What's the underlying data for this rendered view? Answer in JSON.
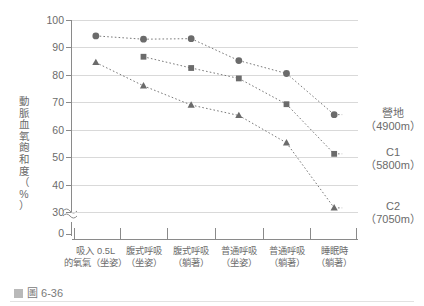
{
  "caption": {
    "marker_icon": "figure-icon",
    "text": "圖 6-36"
  },
  "chart_data": {
    "type": "line",
    "title": "",
    "subtitle": "",
    "xlabel": "",
    "ylabel": "動脈血氧飽和度（%）",
    "ylabel_chars": [
      "動",
      "脈",
      "血",
      "氧",
      "飽",
      "和",
      "度",
      "（",
      "%",
      "）"
    ],
    "ylim": [
      30,
      100
    ],
    "yticks": [
      100,
      90,
      80,
      70,
      60,
      50,
      40,
      30
    ],
    "y_axis_break": true,
    "y_break_base_tick": 0,
    "grid": true,
    "grid_axis": "y",
    "legend_position": "right",
    "categories": [
      "吸入 0.5L 的氧氣（坐姿）",
      "腹式呼吸（坐姿）",
      "腹式呼吸（躺著）",
      "普通呼吸（坐姿）",
      "普通呼吸（躺著）",
      "睡眠時（躺著）"
    ],
    "category_lines": [
      {
        "line1": "吸入 0.5L",
        "line2": "的氧氣（坐姿）"
      },
      {
        "line1": "腹式呼吸",
        "line2": "（坐姿）"
      },
      {
        "line1": "腹式呼吸",
        "line2": "（躺著）"
      },
      {
        "line1": "普通呼吸",
        "line2": "（坐姿）"
      },
      {
        "line1": "普通呼吸",
        "line2": "（躺著）"
      },
      {
        "line1": "睡眠時",
        "line2": "（躺著）"
      }
    ],
    "series": [
      {
        "name": "營地",
        "altitude": "（4900m）",
        "marker": "circle",
        "color": "#6b6b6b",
        "values": [
          94.2,
          93.0,
          93.2,
          85.2,
          80.5,
          65.5
        ]
      },
      {
        "name": "C1",
        "altitude": "（5800m）",
        "marker": "square",
        "color": "#6b6b6b",
        "values": [
          null,
          86.6,
          82.5,
          78.7,
          69.3,
          51.2
        ]
      },
      {
        "name": "C2",
        "altitude": "（7050m）",
        "marker": "triangle",
        "color": "#6b6b6b",
        "values": [
          84.5,
          76.0,
          69.0,
          65.2,
          55.2,
          31.5
        ]
      }
    ]
  },
  "colors": {
    "grid": "#d9d9d9",
    "axis": "#8a8a8a",
    "text": "#6b6b6b",
    "marker": "#6b6b6b"
  }
}
